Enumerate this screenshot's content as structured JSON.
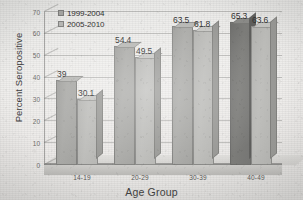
{
  "chart_data": {
    "type": "bar",
    "title": "",
    "xlabel": "Age Group",
    "ylabel": "Percent Seropositive",
    "categories": [
      "14-19",
      "20-29",
      "30-39",
      "40-49"
    ],
    "series": [
      {
        "name": "1999-2004",
        "values": [
          39,
          54.4,
          63.5,
          65.3
        ],
        "color": "#a3a3a0"
      },
      {
        "name": "2005-2010",
        "values": [
          30.1,
          49.5,
          61.8,
          63.6
        ],
        "color": "#b6b6b3"
      }
    ],
    "value_labels": [
      [
        "39",
        "30.1"
      ],
      [
        "54.4",
        "49.5"
      ],
      [
        "63.5",
        "61.8"
      ],
      [
        "65.3",
        "63.6"
      ]
    ],
    "ylim": [
      0,
      70
    ],
    "yticks": [
      0,
      10,
      20,
      30,
      40,
      50,
      60,
      70
    ],
    "ytick_labels": [
      "0",
      "10",
      "20",
      "30",
      "40",
      "50",
      "60",
      "70"
    ],
    "grid": true,
    "legend_position": "top-left",
    "style": "3d-bar"
  }
}
